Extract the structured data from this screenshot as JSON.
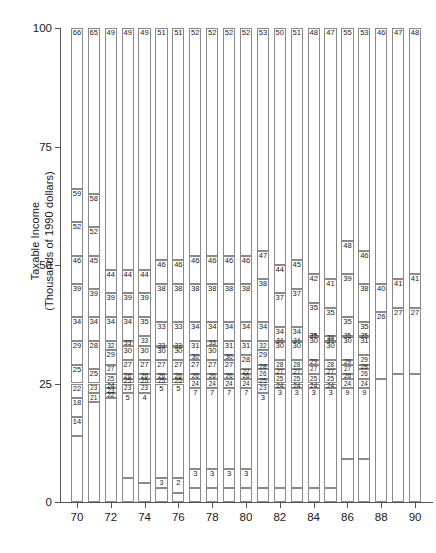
{
  "chart_data": {
    "type": "bar",
    "title": "",
    "subtitle": "",
    "xlabel": "",
    "ylabel": "Taxable Income\n(Thousands of 1990 dollars)",
    "ylim": [
      0,
      100
    ],
    "y_ticks": [
      0,
      25,
      50,
      75,
      100
    ],
    "y_tick_labels": [
      "0",
      "25",
      "50",
      "75",
      "100"
    ],
    "xlim": [
      69,
      91
    ],
    "x_ticks": [
      70,
      72,
      74,
      76,
      78,
      80,
      82,
      84,
      86,
      88,
      90
    ],
    "x_tick_labels": [
      "70",
      "72",
      "74",
      "76",
      "78",
      "80",
      "82",
      "84",
      "86",
      "88",
      "90"
    ],
    "grid": false,
    "legend": null,
    "categories": [
      "70",
      "71",
      "72",
      "73",
      "74",
      "75",
      "76",
      "77",
      "78",
      "79",
      "80",
      "81",
      "82",
      "83",
      "84",
      "85",
      "86",
      "87",
      "88",
      "89",
      "90"
    ],
    "bars": [
      {
        "x": 70,
        "boundaries": [
          100,
          66,
          59,
          52,
          46,
          39,
          34,
          29,
          25,
          22,
          18,
          14,
          0
        ]
      },
      {
        "x": 71,
        "boundaries": [
          100,
          65,
          58,
          52,
          45,
          39,
          34,
          28,
          25,
          23,
          21,
          0
        ]
      },
      {
        "x": 72,
        "boundaries": [
          100,
          49,
          44,
          39,
          34,
          32,
          29,
          27,
          25,
          24,
          23,
          22,
          0
        ]
      },
      {
        "x": 73,
        "boundaries": [
          100,
          49,
          44,
          39,
          34,
          33,
          30,
          27,
          26,
          25,
          23,
          5,
          0
        ]
      },
      {
        "x": 74,
        "boundaries": [
          100,
          49,
          44,
          39,
          35,
          33,
          30,
          27,
          26,
          25,
          23,
          4,
          0
        ]
      },
      {
        "x": 75,
        "boundaries": [
          100,
          51,
          46,
          38,
          33,
          33,
          30,
          27,
          26,
          25,
          5,
          3,
          0
        ]
      },
      {
        "x": 76,
        "boundaries": [
          100,
          51,
          46,
          38,
          33,
          33,
          30,
          27,
          26,
          25,
          5,
          2,
          0
        ]
      },
      {
        "x": 77,
        "boundaries": [
          100,
          52,
          46,
          38,
          34,
          31,
          30,
          27,
          26,
          24,
          7,
          3,
          0
        ]
      },
      {
        "x": 78,
        "boundaries": [
          100,
          52,
          46,
          38,
          34,
          33,
          30,
          27,
          26,
          24,
          7,
          3,
          0
        ]
      },
      {
        "x": 79,
        "boundaries": [
          100,
          52,
          46,
          38,
          34,
          31,
          30,
          27,
          26,
          24,
          7,
          3,
          0
        ]
      },
      {
        "x": 80,
        "boundaries": [
          100,
          52,
          46,
          38,
          34,
          31,
          28,
          27,
          26,
          24,
          7,
          3,
          0
        ]
      },
      {
        "x": 81,
        "boundaries": [
          100,
          53,
          47,
          38,
          34,
          32,
          29,
          28,
          26,
          25,
          23,
          3,
          0
        ]
      },
      {
        "x": 82,
        "boundaries": [
          100,
          50,
          44,
          37,
          34,
          34,
          30,
          28,
          27,
          25,
          24,
          3,
          0
        ]
      },
      {
        "x": 83,
        "boundaries": [
          100,
          51,
          45,
          37,
          34,
          34,
          30,
          28,
          27,
          25,
          24,
          3,
          0
        ]
      },
      {
        "x": 84,
        "boundaries": [
          100,
          48,
          42,
          35,
          35,
          35,
          30,
          29,
          27,
          25,
          24,
          3,
          0
        ]
      },
      {
        "x": 85,
        "boundaries": [
          100,
          47,
          41,
          35,
          34,
          34,
          30,
          28,
          27,
          25,
          24,
          3,
          0
        ]
      },
      {
        "x": 86,
        "boundaries": [
          100,
          55,
          48,
          39,
          35,
          35,
          30,
          29,
          27,
          26,
          24,
          9,
          0
        ]
      },
      {
        "x": 87,
        "boundaries": [
          100,
          53,
          46,
          38,
          35,
          35,
          31,
          29,
          28,
          26,
          24,
          9,
          0
        ]
      },
      {
        "x": 88,
        "boundaries": [
          100,
          46,
          40,
          26,
          0
        ]
      },
      {
        "x": 89,
        "boundaries": [
          100,
          47,
          41,
          27,
          0
        ]
      },
      {
        "x": 90,
        "boundaries": [
          100,
          48,
          41,
          27,
          0
        ]
      }
    ]
  },
  "axes": {
    "y_title_line1": "Taxable Income",
    "y_title_line2": "(Thousands of 1990 dollars)"
  }
}
